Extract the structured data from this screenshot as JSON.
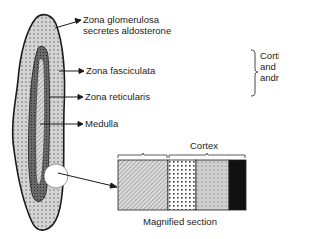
{
  "labels": {
    "glomerulosa_line1": "Zona glomerulosa",
    "glomerulosa_line2": "secretes aldosterone",
    "fasciculata": "Zona fasciculata",
    "reticularis": "Zona reticularis",
    "medulla": "Medulla",
    "bracket_line1": "Cortisol",
    "bracket_line2": "and",
    "bracket_line3": "androgens",
    "cortex": "Cortex",
    "magnified": "Magnified section"
  },
  "colors": {
    "outline": "#1a1a1a",
    "glomerulosa_fill": "#cfcfcf",
    "fasciculata_fill": "#6e6e6e",
    "medulla_fill": "#bdbdbd",
    "black_zone": "#111111"
  }
}
